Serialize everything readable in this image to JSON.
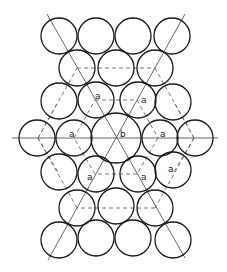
{
  "diagram": {
    "circles": [
      {
        "cx": 59,
        "cy": 36,
        "r": 18
      },
      {
        "cx": 96,
        "cy": 36,
        "r": 18
      },
      {
        "cx": 133,
        "cy": 36,
        "r": 18
      },
      {
        "cx": 172,
        "cy": 36,
        "r": 18
      },
      {
        "cx": 77,
        "cy": 68,
        "r": 18
      },
      {
        "cx": 116,
        "cy": 68,
        "r": 18
      },
      {
        "cx": 155,
        "cy": 68,
        "r": 18
      },
      {
        "cx": 59,
        "cy": 101,
        "r": 18
      },
      {
        "cx": 96,
        "cy": 100,
        "r": 18
      },
      {
        "cx": 138,
        "cy": 100,
        "r": 18
      },
      {
        "cx": 173,
        "cy": 102,
        "r": 18
      },
      {
        "cx": 37,
        "cy": 138,
        "r": 18
      },
      {
        "cx": 74,
        "cy": 138,
        "r": 18
      },
      {
        "cx": 116,
        "cy": 138,
        "r": 25
      },
      {
        "cx": 160,
        "cy": 138,
        "r": 18
      },
      {
        "cx": 195,
        "cy": 138,
        "r": 18
      },
      {
        "cx": 59,
        "cy": 172,
        "r": 18
      },
      {
        "cx": 96,
        "cy": 174,
        "r": 18
      },
      {
        "cx": 138,
        "cy": 174,
        "r": 18
      },
      {
        "cx": 173,
        "cy": 170,
        "r": 18
      },
      {
        "cx": 77,
        "cy": 208,
        "r": 18
      },
      {
        "cx": 116,
        "cy": 206,
        "r": 18
      },
      {
        "cx": 155,
        "cy": 208,
        "r": 18
      },
      {
        "cx": 59,
        "cy": 240,
        "r": 18
      },
      {
        "cx": 96,
        "cy": 238,
        "r": 18
      },
      {
        "cx": 133,
        "cy": 238,
        "r": 18
      },
      {
        "cx": 173,
        "cy": 240,
        "r": 18
      }
    ],
    "solid_lines": [
      {
        "x1": 12,
        "y1": 138,
        "x2": 218,
        "y2": 138
      },
      {
        "x1": 47,
        "y1": 14,
        "x2": 185,
        "y2": 258
      },
      {
        "x1": 185,
        "y1": 14,
        "x2": 48,
        "y2": 260
      }
    ],
    "dashed_lines": [
      {
        "x1": 77,
        "y1": 68,
        "x2": 155,
        "y2": 68
      },
      {
        "x1": 155,
        "y1": 68,
        "x2": 194,
        "y2": 138
      },
      {
        "x1": 194,
        "y1": 138,
        "x2": 155,
        "y2": 208
      },
      {
        "x1": 155,
        "y1": 208,
        "x2": 77,
        "y2": 208
      },
      {
        "x1": 77,
        "y1": 208,
        "x2": 38,
        "y2": 138
      },
      {
        "x1": 38,
        "y1": 138,
        "x2": 77,
        "y2": 68
      },
      {
        "x1": 95,
        "y1": 100,
        "x2": 137,
        "y2": 100
      },
      {
        "x1": 137,
        "y1": 100,
        "x2": 158,
        "y2": 138
      },
      {
        "x1": 158,
        "y1": 138,
        "x2": 137,
        "y2": 174
      },
      {
        "x1": 137,
        "y1": 174,
        "x2": 95,
        "y2": 174
      },
      {
        "x1": 95,
        "y1": 174,
        "x2": 74,
        "y2": 138
      },
      {
        "x1": 74,
        "y1": 138,
        "x2": 95,
        "y2": 100
      },
      {
        "x1": 38,
        "y1": 138,
        "x2": 58,
        "y2": 172
      },
      {
        "x1": 38,
        "y1": 138,
        "x2": 58,
        "y2": 102
      },
      {
        "x1": 194,
        "y1": 138,
        "x2": 174,
        "y2": 102
      },
      {
        "x1": 194,
        "y1": 138,
        "x2": 174,
        "y2": 172
      }
    ],
    "labels": [
      {
        "text": "a",
        "x": 95,
        "y": 99
      },
      {
        "text": "a",
        "x": 141,
        "y": 103
      },
      {
        "text": "a",
        "x": 69,
        "y": 137
      },
      {
        "text": "b",
        "x": 120,
        "y": 137
      },
      {
        "text": "a",
        "x": 160,
        "y": 137
      },
      {
        "text": "a",
        "x": 87,
        "y": 180
      },
      {
        "text": "a",
        "x": 141,
        "y": 180
      },
      {
        "text": "a",
        "x": 168,
        "y": 172
      }
    ]
  }
}
